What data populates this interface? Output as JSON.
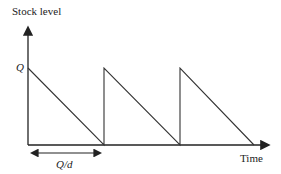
{
  "diagram": {
    "y_axis_label": "Stock level",
    "x_axis_label": "Time",
    "level_label": "Q",
    "interval_label": "Q/d",
    "cycles": 3,
    "line_color": "#333333"
  }
}
